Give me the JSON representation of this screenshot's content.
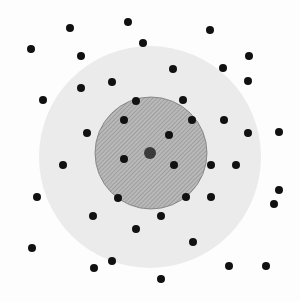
{
  "diagram": {
    "width": 300,
    "height": 302,
    "colors": {
      "background": "#fdfdfd",
      "outer_region": "#ebebeb",
      "inner_region": "#b9b9b9",
      "inner_hatch": "#8c8c8c",
      "inner_border": "#7a7a7a",
      "dot": "#111111",
      "center_dot": "#3a3a3a"
    },
    "outer_circle": {
      "cx": 150,
      "cy": 157,
      "r": 111
    },
    "inner_circle": {
      "cx": 151,
      "cy": 153,
      "r": 56,
      "pattern": "diagonal-hatch"
    },
    "center_point": {
      "cx": 150,
      "cy": 153,
      "r": 6
    },
    "dot_radius": 4,
    "points": [
      [
        128,
        22
      ],
      [
        210,
        30
      ],
      [
        70,
        28
      ],
      [
        143,
        43
      ],
      [
        31,
        49
      ],
      [
        81,
        56
      ],
      [
        249,
        56
      ],
      [
        173,
        69
      ],
      [
        223,
        68
      ],
      [
        112,
        82
      ],
      [
        248,
        81
      ],
      [
        81,
        88
      ],
      [
        43,
        100
      ],
      [
        136,
        101
      ],
      [
        183,
        100
      ],
      [
        124,
        120
      ],
      [
        192,
        120
      ],
      [
        224,
        120
      ],
      [
        87,
        133
      ],
      [
        169,
        135
      ],
      [
        248,
        133
      ],
      [
        279,
        132
      ],
      [
        124,
        159
      ],
      [
        63,
        165
      ],
      [
        174,
        165
      ],
      [
        211,
        165
      ],
      [
        236,
        165
      ],
      [
        279,
        190
      ],
      [
        37,
        197
      ],
      [
        118,
        198
      ],
      [
        186,
        197
      ],
      [
        211,
        197
      ],
      [
        274,
        204
      ],
      [
        93,
        216
      ],
      [
        161,
        216
      ],
      [
        136,
        229
      ],
      [
        193,
        242
      ],
      [
        32,
        248
      ],
      [
        112,
        261
      ],
      [
        94,
        268
      ],
      [
        229,
        266
      ],
      [
        266,
        266
      ],
      [
        161,
        279
      ]
    ]
  }
}
